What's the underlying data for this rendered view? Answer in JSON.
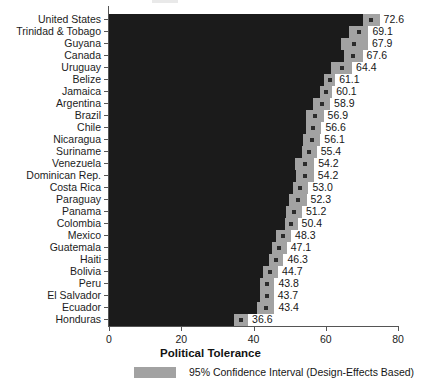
{
  "chart_data": {
    "type": "bar",
    "orientation": "horizontal",
    "title": "",
    "xlabel": "Political Tolerance",
    "ylabel": "",
    "xlim": [
      0,
      80
    ],
    "xticks": [
      0,
      20,
      40,
      60,
      80
    ],
    "grid": false,
    "legend": {
      "position": "bottom",
      "entries": [
        {
          "label": "95% Confidence Interval (Design-Effects Based)",
          "color": "#a2a2a2"
        }
      ]
    },
    "series": [
      {
        "name": "Political Tolerance",
        "color": "#1b1b1b"
      }
    ],
    "categories": [
      "United States",
      "Trinidad & Tobago",
      "Guyana",
      "Canada",
      "Uruguay",
      "Belize",
      "Jamaica",
      "Argentina",
      "Brazil",
      "Chile",
      "Nicaragua",
      "Suriname",
      "Venezuela",
      "Dominican Rep.",
      "Costa Rica",
      "Paraguay",
      "Panama",
      "Colombia",
      "Mexico",
      "Guatemala",
      "Haiti",
      "Bolivia",
      "Peru",
      "El Salvador",
      "Ecuador",
      "Honduras"
    ],
    "values": [
      72.6,
      69.1,
      67.9,
      67.6,
      64.4,
      61.1,
      60.1,
      58.9,
      56.9,
      56.6,
      56.1,
      55.4,
      54.2,
      54.2,
      53.0,
      52.3,
      51.2,
      50.4,
      48.3,
      47.1,
      46.3,
      44.7,
      43.8,
      43.7,
      43.4,
      36.6
    ],
    "value_labels": [
      "72.6",
      "69.1",
      "67.9",
      "67.6",
      "64.4",
      "61.1",
      "60.1",
      "58.9",
      "56.9",
      "56.6",
      "56.1",
      "55.4",
      "54.2",
      "54.2",
      "53.0",
      "52.3",
      "51.2",
      "50.4",
      "48.3",
      "47.1",
      "46.3",
      "44.7",
      "43.8",
      "43.7",
      "43.4",
      "36.6"
    ],
    "ci_low": [
      70.3,
      66.4,
      64.1,
      65.0,
      61.5,
      59.6,
      58.4,
      56.6,
      54.4,
      54.4,
      53.7,
      53.3,
      51.6,
      51.7,
      50.8,
      49.9,
      49.0,
      48.6,
      46.2,
      45.0,
      44.3,
      42.6,
      41.8,
      41.8,
      41.0,
      34.7
    ],
    "ci_high": [
      74.9,
      71.8,
      71.7,
      70.2,
      67.3,
      62.6,
      61.8,
      61.2,
      59.4,
      58.8,
      58.5,
      57.5,
      56.8,
      56.7,
      55.2,
      54.7,
      53.4,
      52.2,
      50.4,
      49.2,
      48.3,
      46.8,
      45.8,
      45.6,
      45.8,
      38.5
    ]
  },
  "axis": {
    "x_title": "Political Tolerance",
    "tick_labels": [
      "0",
      "20",
      "40",
      "60",
      "80"
    ]
  },
  "legend_text": "95% Confidence Interval (Design-Effects Based)"
}
